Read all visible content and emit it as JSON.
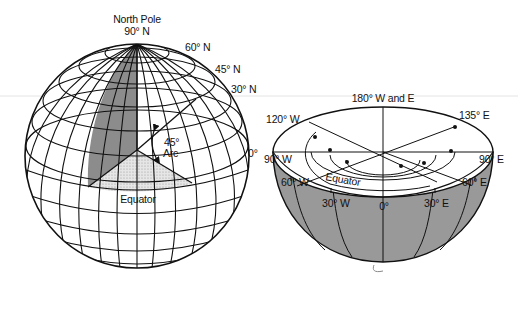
{
  "figure": {
    "left_globe": {
      "title": "North Pole",
      "pole_label": "90° N",
      "latitude_labels": [
        "60° N",
        "45° N",
        "30° N"
      ],
      "meridian_label": "0°",
      "arc_label_line1": "45°",
      "arc_label_line2": "Arc",
      "equator_label": "Equator",
      "colors": {
        "wedge_fill": "#8c8c8c",
        "equator_wedge_fill": "#d9d9d9",
        "line": "#111111"
      }
    },
    "right_hemisphere": {
      "top_label": "180° W and E",
      "longitude_labels": {
        "w120": "120° W",
        "e135": "135° E",
        "w90": "90° W",
        "e90": "90° E",
        "w60": "60° W",
        "e60": "60° E",
        "w30": "30° W",
        "e30": "30° E",
        "zero": "0°"
      },
      "equator_label": "Equator",
      "colors": {
        "shell_fill": "#999999",
        "disc_fill": "#ffffff",
        "line": "#111111"
      }
    },
    "background": "#ffffff"
  }
}
